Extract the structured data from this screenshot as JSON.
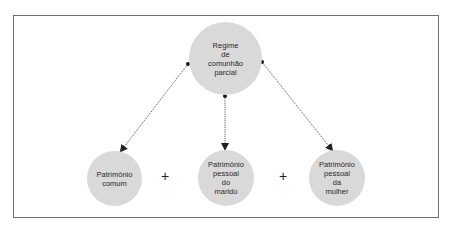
{
  "diagram": {
    "root": {
      "label": "Regime\nde\ncomunhão\nparcial"
    },
    "children": [
      {
        "label": "Patrimônio\ncomum"
      },
      {
        "label": "Patrimônio\npessoal\ndo\nmarido"
      },
      {
        "label": "Patrimônio\npessoal\nda\nmulher"
      }
    ],
    "operators": [
      "+",
      "+"
    ],
    "colors": {
      "node_fill": "#d9d9d9",
      "frame": "#6f6f6f",
      "arrow": "#222222"
    }
  }
}
